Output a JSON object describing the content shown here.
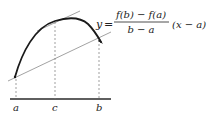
{
  "diagram": {
    "colors": {
      "curve": "#1a1a1a",
      "axis": "#2a2a2a",
      "thin_lines": "#8a8a8a",
      "dashed": "#777777",
      "text": "#222222"
    },
    "axis_labels": {
      "a": "a",
      "c": "c",
      "b": "b"
    },
    "equation": {
      "lhs": "y",
      "equals": "=",
      "numerator": "f(b) − f(a)",
      "denominator": "b − a",
      "factor": "(x − a)"
    }
  }
}
